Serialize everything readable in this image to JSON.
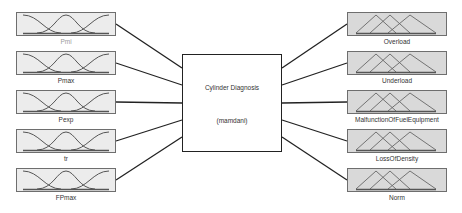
{
  "diagram": {
    "type": "fuzzy-inference-system",
    "system": {
      "name": "Cylinder Diagnosis",
      "method": "(mamdani)"
    },
    "inputs": [
      {
        "label": "Pmi",
        "mf_shape": "z-gauss-s"
      },
      {
        "label": "Pmax",
        "mf_shape": "z-gauss-s"
      },
      {
        "label": "Pexp",
        "mf_shape": "z-gauss-s"
      },
      {
        "label": "tr",
        "mf_shape": "z-gauss-s"
      },
      {
        "label": "FPmax",
        "mf_shape": "z-gauss-s"
      }
    ],
    "outputs": [
      {
        "label": "Overload",
        "mf_shape": "triangular"
      },
      {
        "label": "Underload",
        "mf_shape": "triangular"
      },
      {
        "label": "MalfunctionOfFuelEquipment",
        "mf_shape": "triangular"
      },
      {
        "label": "LossOfDensity",
        "mf_shape": "triangular"
      },
      {
        "label": "Norm",
        "mf_shape": "triangular"
      }
    ],
    "colors": {
      "input_box_bg": "#ececec",
      "output_box_bg": "#d9d9d9",
      "box_border": "#6e6e6e",
      "mf_line": "#555555",
      "connector": "#222222"
    }
  }
}
